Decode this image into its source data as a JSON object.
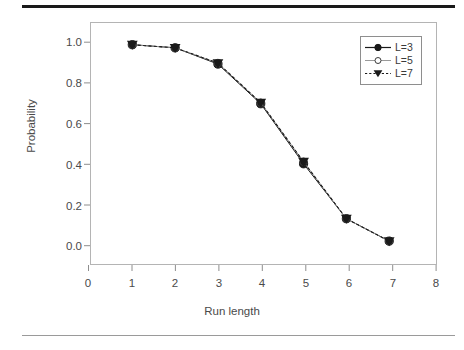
{
  "figure": {
    "background_color": "#ffffff",
    "top_rule_color": "#1a1a1a",
    "bottom_rule_color": "#9a9a9a"
  },
  "chart_data": {
    "type": "line",
    "title": "",
    "subtitle": "",
    "xlabel": "Run length",
    "ylabel": "Probability",
    "xlim": [
      0,
      8
    ],
    "ylim": [
      0.0,
      1.0
    ],
    "xticks": [
      0,
      1,
      2,
      3,
      4,
      5,
      6,
      7,
      8
    ],
    "xtick_labels": [
      "0",
      "1",
      "2",
      "3",
      "4",
      "5",
      "6",
      "7",
      "8"
    ],
    "yticks": [
      0.0,
      0.2,
      0.4,
      0.6,
      0.8,
      1.0
    ],
    "ytick_labels": [
      "0.0",
      "0.2",
      "0.4",
      "0.6",
      "0.8",
      "1.0"
    ],
    "grid": false,
    "legend_position": "upper right",
    "x": [
      1,
      2,
      3,
      4,
      5,
      6,
      7
    ],
    "series": [
      {
        "name": "L=3",
        "legend_label": "L=3",
        "marker": "filled-circle",
        "linestyle": "solid",
        "color": "#1a1a1a",
        "values": [
          0.99,
          0.975,
          0.895,
          0.7,
          0.405,
          0.135,
          0.025
        ]
      },
      {
        "name": "L=5",
        "legend_label": "L=5",
        "marker": "open-circle",
        "linestyle": "solid",
        "color": "#1a1a1a",
        "values": [
          0.99,
          0.975,
          0.9,
          0.705,
          0.415,
          0.135,
          0.025
        ]
      },
      {
        "name": "L=7",
        "legend_label": "L=7",
        "marker": "filled-triangle-down",
        "linestyle": "dashed",
        "color": "#1a1a1a",
        "values": [
          0.99,
          0.975,
          0.9,
          0.705,
          0.415,
          0.135,
          0.025
        ]
      }
    ]
  },
  "axis": {
    "y_title": "Probability",
    "x_title": "Run length",
    "y_labels": [
      "1.0",
      "0.8",
      "0.6",
      "0.4",
      "0.2",
      "0.0"
    ],
    "x_labels": [
      "0",
      "1",
      "2",
      "3",
      "4",
      "5",
      "6",
      "7",
      "8"
    ]
  },
  "legend": {
    "entries": [
      {
        "label": "L=3"
      },
      {
        "label": "L=5"
      },
      {
        "label": "L=7"
      }
    ]
  }
}
